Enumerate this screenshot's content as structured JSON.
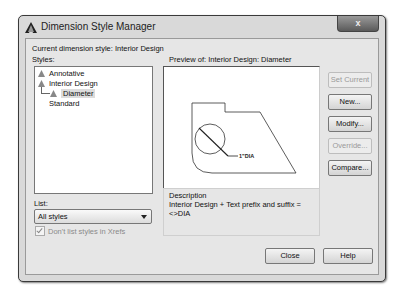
{
  "window": {
    "title": "Dimension Style Manager",
    "close_label": "x"
  },
  "current_style": "Current dimension style: Interior Design",
  "styles": {
    "label": "Styles:",
    "items": [
      {
        "label": "Annotative",
        "icon": "annotative-triangle-icon"
      },
      {
        "label": "Interior Design",
        "icon": "annotative-triangle-icon"
      },
      {
        "label": "Diameter",
        "icon": "annotative-triangle-icon",
        "child": true,
        "selected": true
      },
      {
        "label": "Standard"
      }
    ]
  },
  "preview": {
    "label": "Preview of: Interior Design: Diameter",
    "dimension_text": "1\"DIA"
  },
  "description": {
    "title": "Description",
    "text": "Interior Design + Text prefix and suffix = <>DIA"
  },
  "buttons": {
    "set_current": "Set Current",
    "new": "New...",
    "modify": "Modify...",
    "override": "Override...",
    "compare": "Compare...",
    "close": "Close",
    "help": "Help"
  },
  "list": {
    "label": "List:",
    "selected": "All styles",
    "xref_checkbox": "Don't list styles in Xrefs",
    "xref_checked": true
  }
}
